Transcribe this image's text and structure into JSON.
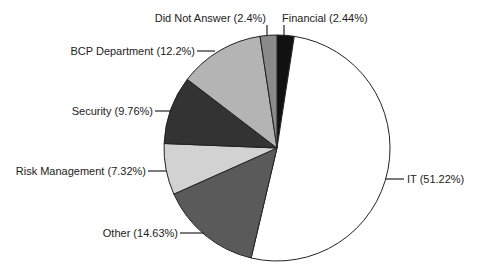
{
  "chart_data": {
    "type": "pie",
    "title": "",
    "start_angle_deg": 0,
    "direction": "clockwise",
    "slices": [
      {
        "label": "Financial",
        "value": 2.44,
        "display": "Financial (2.44%)",
        "color": "#111111"
      },
      {
        "label": "IT",
        "value": 51.22,
        "display": "IT (51.22%)",
        "color": "#ffffff"
      },
      {
        "label": "Other",
        "value": 14.63,
        "display": "Other (14.63%)",
        "color": "#5a5a5a"
      },
      {
        "label": "Risk Management",
        "value": 7.32,
        "display": "Risk Management (7.32%)",
        "color": "#d2d2d2"
      },
      {
        "label": "Security",
        "value": 9.76,
        "display": "Security (9.76%)",
        "color": "#333333"
      },
      {
        "label": "BCP Department",
        "value": 12.2,
        "display": "BCP Department (12.2%)",
        "color": "#b4b4b4"
      },
      {
        "label": "Did Not Answer",
        "value": 2.4,
        "display": "Did Not Answer (2.4%)",
        "color": "#8a8a8a"
      }
    ],
    "legend": "none",
    "labels": "outside with leader lines"
  },
  "geometry": {
    "cx": 277,
    "cy": 148,
    "r": 113
  },
  "label_layout": [
    {
      "idx": 0,
      "tx": 282,
      "ty": 22,
      "anchor": "start",
      "line": [
        [
          284,
          25
        ],
        [
          284,
          36
        ]
      ],
      "leader": "vertical"
    },
    {
      "idx": 1,
      "tx": 407,
      "ty": 183,
      "anchor": "start",
      "line": [
        [
          385,
          179
        ],
        [
          404,
          179
        ]
      ],
      "leader": "horizontal"
    },
    {
      "idx": 2,
      "tx": 178,
      "ty": 237,
      "anchor": "end",
      "line": [
        [
          180,
          233
        ],
        [
          204,
          233
        ]
      ],
      "leader": "horizontal"
    },
    {
      "idx": 3,
      "tx": 146,
      "ty": 175,
      "anchor": "end",
      "line": [
        [
          148,
          171
        ],
        [
          166,
          171
        ]
      ],
      "leader": "horizontal"
    },
    {
      "idx": 4,
      "tx": 153,
      "ty": 115,
      "anchor": "end",
      "line": [
        [
          155,
          111
        ],
        [
          172,
          111
        ]
      ],
      "leader": "horizontal"
    },
    {
      "idx": 5,
      "tx": 195,
      "ty": 55,
      "anchor": "end",
      "line": [
        [
          197,
          51
        ],
        [
          215,
          51
        ]
      ],
      "leader": "horizontal"
    },
    {
      "idx": 6,
      "tx": 266,
      "ty": 22,
      "anchor": "end",
      "line": [
        [
          267,
          25
        ],
        [
          267,
          36
        ]
      ],
      "leader": "vertical"
    }
  ]
}
